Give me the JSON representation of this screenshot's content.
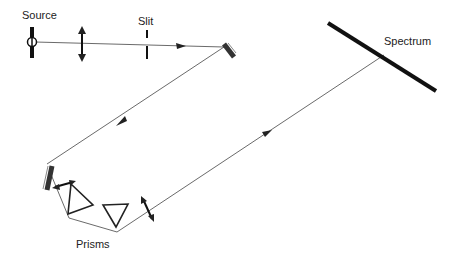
{
  "diagram": {
    "title": "",
    "labels": {
      "source": "Source",
      "slit": "Slit",
      "spectrum": "Spectrum",
      "prisms": "Prisms"
    },
    "components": [
      {
        "id": "source",
        "type": "light-source"
      },
      {
        "id": "lens1",
        "type": "lens"
      },
      {
        "id": "slit",
        "type": "slit"
      },
      {
        "id": "mirror1",
        "type": "mirror"
      },
      {
        "id": "mirror2",
        "type": "mirror"
      },
      {
        "id": "lens2",
        "type": "lens"
      },
      {
        "id": "prism1",
        "type": "prism"
      },
      {
        "id": "prism2",
        "type": "prism"
      },
      {
        "id": "lens3",
        "type": "lens"
      },
      {
        "id": "spectrum",
        "type": "screen"
      }
    ],
    "path": [
      "source",
      "lens1",
      "slit",
      "mirror1",
      "mirror2",
      "lens2",
      "prism1",
      "prism2",
      "lens3",
      "spectrum"
    ]
  }
}
